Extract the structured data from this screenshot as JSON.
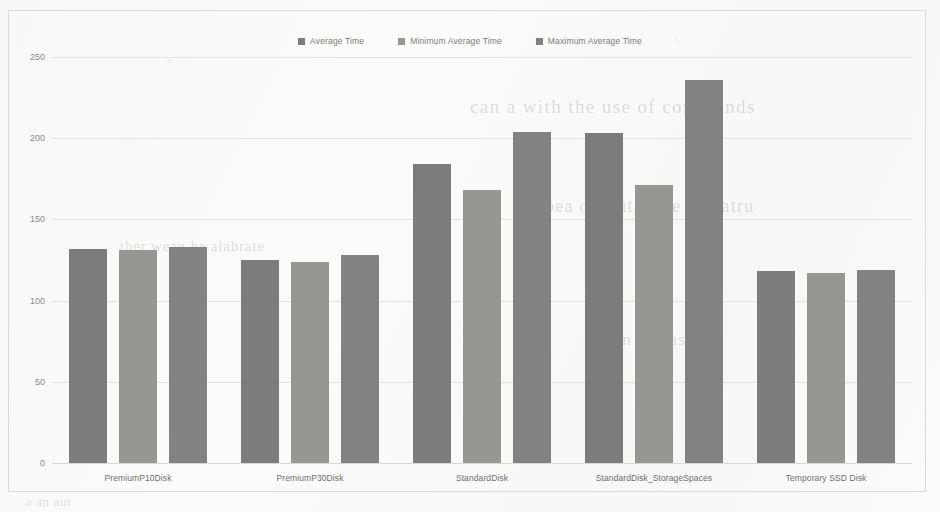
{
  "chart_data": {
    "type": "bar",
    "title": "",
    "xlabel": "",
    "ylabel": "",
    "ylim": [
      0,
      250
    ],
    "yticks": [
      0,
      50,
      100,
      150,
      200,
      250
    ],
    "grid": true,
    "legend_position": "top-center",
    "categories": [
      "PremiumP10Disk",
      "PremiumP30Disk",
      "StandardDisk",
      "StandardDisk_StorageSpaces",
      "Temporary SSD Disk"
    ],
    "series": [
      {
        "name": "Average Time",
        "color": "#7c7c7a",
        "values": [
          132,
          125,
          184,
          203,
          118
        ]
      },
      {
        "name": "Minimum Average Time",
        "color": "#969693",
        "values": [
          131,
          124,
          168,
          171,
          117
        ]
      },
      {
        "name": "Maximum Average Time",
        "color": "#828280",
        "values": [
          133,
          128,
          204,
          236,
          119
        ]
      }
    ]
  },
  "legend": {
    "items": [
      {
        "label": "Average Time"
      },
      {
        "label": "Minimum Average Time"
      },
      {
        "label": "Maximum Average Time"
      }
    ]
  },
  "background_text": {
    "line_a": "can a with the use of commands",
    "line_b": "ua bea of a utar the nor-atru",
    "line_c": "ther wean he alabrate",
    "line_d": "a an nutrus",
    "line_e": "a an aut"
  }
}
